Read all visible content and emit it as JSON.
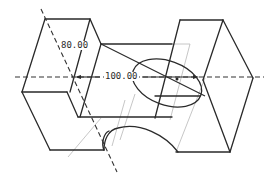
{
  "drawing": {
    "type": "isometric-part-sketch",
    "colors": {
      "background": "#ffffff",
      "edge": "#2a2a2a",
      "hidden_edge": "#b8b8b8",
      "axis": "#333333"
    },
    "dimensions": [
      {
        "id": "dim-80",
        "label": "80.00"
      },
      {
        "id": "dim-100",
        "label": "100.00"
      }
    ],
    "features": [
      "left-block",
      "right-block",
      "center-bridge",
      "bottom-arc-cutout",
      "ellipse-hole"
    ],
    "axes": [
      "horizontal-centerline",
      "diagonal-centerline"
    ]
  }
}
